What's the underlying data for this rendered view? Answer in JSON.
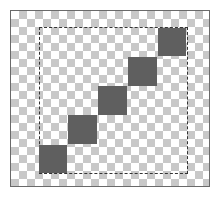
{
  "canvas": {
    "x": 10,
    "y": 10,
    "width": 200,
    "height": 177,
    "border_color": "#6a6a6a",
    "checker_light": "#ffffff",
    "checker_dark": "#c8c8c8"
  },
  "selection": {
    "x": 39,
    "y": 27,
    "width": 149,
    "height": 147,
    "style": "dashed",
    "color": "#333333"
  },
  "squares": [
    {
      "x": 39,
      "y": 145,
      "size": 28,
      "color": "#5f5f5f"
    },
    {
      "x": 68,
      "y": 115,
      "size": 29,
      "color": "#5f5f5f"
    },
    {
      "x": 98,
      "y": 86,
      "size": 29,
      "color": "#5f5f5f"
    },
    {
      "x": 128,
      "y": 57,
      "size": 29,
      "color": "#5f5f5f"
    },
    {
      "x": 158,
      "y": 28,
      "size": 28,
      "color": "#5f5f5f"
    }
  ]
}
